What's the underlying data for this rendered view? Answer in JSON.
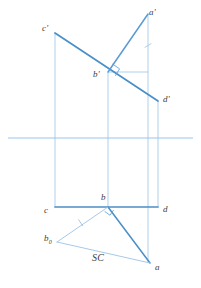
{
  "drawing": {
    "title": "Descriptive geometry projection of plane ABCD",
    "width": 201,
    "height": 288,
    "background": "#ffffff",
    "colors": {
      "line_primary": "#5b9bd5",
      "line_thick": "#4a8fc8",
      "line_thin": "#9cc3e5",
      "ground_line": "#8ec0e8",
      "label_text": "#3c3c3c"
    },
    "labels": [
      {
        "id": "a-prime",
        "text": "a'",
        "x": 149,
        "y": 8,
        "name": "label-a-prime"
      },
      {
        "id": "c-prime",
        "text": "c'",
        "x": 42,
        "y": 24,
        "name": "label-c-prime"
      },
      {
        "id": "b-prime",
        "text": "b'",
        "x": 93,
        "y": 70,
        "name": "label-b-prime"
      },
      {
        "id": "d-prime",
        "text": "d'",
        "x": 163,
        "y": 95,
        "name": "label-d-prime"
      },
      {
        "id": "b",
        "text": "b",
        "x": 101,
        "y": 193,
        "name": "label-b"
      },
      {
        "id": "c",
        "text": "c",
        "x": 44,
        "y": 206,
        "name": "label-c"
      },
      {
        "id": "d",
        "text": "d",
        "x": 163,
        "y": 205,
        "name": "label-d"
      },
      {
        "id": "a",
        "text": "a",
        "x": 155,
        "y": 263,
        "name": "label-a"
      }
    ],
    "label_b0": {
      "text": "b",
      "subscript": "0",
      "x": 44,
      "y": 234,
      "name": "label-b-zero"
    },
    "label_sc": {
      "text": "SC",
      "x": 92,
      "y": 253,
      "name": "label-sc"
    },
    "points": {
      "a_prime": {
        "x": 148,
        "y": 14
      },
      "c_prime": {
        "x": 55,
        "y": 33
      },
      "b_prime": {
        "x": 108,
        "y": 72
      },
      "d_prime": {
        "x": 158,
        "y": 101
      },
      "c": {
        "x": 55,
        "y": 207
      },
      "b": {
        "x": 108,
        "y": 207
      },
      "d": {
        "x": 158,
        "y": 207
      },
      "a": {
        "x": 150,
        "y": 263
      },
      "b_zero": {
        "x": 57,
        "y": 242
      },
      "v_right": {
        "x": 148,
        "y": 207
      }
    },
    "ground_line": {
      "x1": 8,
      "y1": 138,
      "x2": 193,
      "y2": 138,
      "name": "ground-line-xy"
    },
    "segments": {
      "cd_prime": {
        "name": "segment-c-prime-d-prime"
      },
      "a_prime_b_prime": {
        "name": "segment-a-prime-b-prime"
      },
      "cd_plan": {
        "name": "segment-c-d-plan"
      },
      "b_a": {
        "name": "segment-b-a"
      },
      "b_b0": {
        "name": "segment-b-b-zero"
      },
      "b0_a": {
        "name": "segment-b-zero-a"
      }
    },
    "tick_marks": [
      {
        "id": "tick-vertical-aa",
        "name": "tick-mark-upper"
      },
      {
        "id": "tick-bb0",
        "name": "tick-mark-lower"
      }
    ],
    "right_angle_marks": [
      {
        "id": "right-angle-upper",
        "name": "right-angle-mark-b-prime"
      },
      {
        "id": "right-angle-lower",
        "name": "right-angle-mark-b"
      }
    ]
  }
}
